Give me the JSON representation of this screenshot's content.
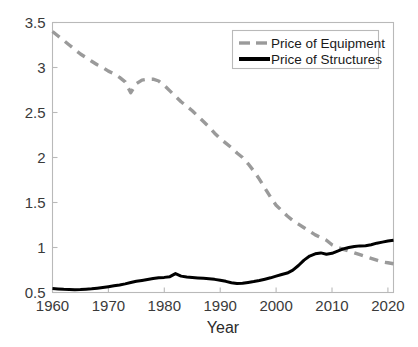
{
  "chart_data": {
    "type": "line",
    "title": "",
    "xlabel": "Year",
    "ylabel": "",
    "xlim": [
      1960,
      2021
    ],
    "ylim": [
      0.5,
      3.5
    ],
    "xticks": [
      1960,
      1970,
      1980,
      1990,
      2000,
      2010,
      2020
    ],
    "xtick_labels": [
      "1960",
      "1970",
      "1980",
      "1990",
      "2000",
      "2010",
      "2020"
    ],
    "yticks": [
      0.5,
      1,
      1.5,
      2,
      2.5,
      3,
      3.5
    ],
    "ytick_labels": [
      "0.5",
      "1",
      "1.5",
      "2",
      "2.5",
      "3",
      "3.5"
    ],
    "grid": false,
    "legend_position": "top-right",
    "x": [
      1960,
      1961,
      1962,
      1963,
      1964,
      1965,
      1966,
      1967,
      1968,
      1969,
      1970,
      1971,
      1972,
      1973,
      1974,
      1975,
      1976,
      1977,
      1978,
      1979,
      1980,
      1981,
      1982,
      1983,
      1984,
      1985,
      1986,
      1987,
      1988,
      1989,
      1990,
      1991,
      1992,
      1993,
      1994,
      1995,
      1996,
      1997,
      1998,
      1999,
      2000,
      2001,
      2002,
      2003,
      2004,
      2005,
      2006,
      2007,
      2008,
      2009,
      2010,
      2011,
      2012,
      2013,
      2014,
      2015,
      2016,
      2017,
      2018,
      2019,
      2020,
      2021
    ],
    "series": [
      {
        "name": "Price of Equipment",
        "color": "#9a9a9a",
        "style": "dashed",
        "width": 3.4,
        "values": [
          3.4,
          3.35,
          3.3,
          3.25,
          3.2,
          3.15,
          3.11,
          3.07,
          3.03,
          3.0,
          2.96,
          2.93,
          2.89,
          2.84,
          2.72,
          2.82,
          2.86,
          2.87,
          2.87,
          2.85,
          2.8,
          2.74,
          2.68,
          2.62,
          2.57,
          2.52,
          2.46,
          2.4,
          2.34,
          2.27,
          2.21,
          2.16,
          2.11,
          2.05,
          2.0,
          1.93,
          1.85,
          1.76,
          1.66,
          1.56,
          1.47,
          1.41,
          1.35,
          1.3,
          1.26,
          1.22,
          1.18,
          1.14,
          1.11,
          1.08,
          1.03,
          1.0,
          0.98,
          0.96,
          0.94,
          0.92,
          0.9,
          0.88,
          0.86,
          0.84,
          0.83,
          0.82
        ]
      },
      {
        "name": "Price of Structures",
        "color": "#000000",
        "style": "solid",
        "width": 3.0,
        "values": [
          0.545,
          0.54,
          0.535,
          0.532,
          0.53,
          0.532,
          0.536,
          0.541,
          0.548,
          0.556,
          0.565,
          0.575,
          0.584,
          0.596,
          0.611,
          0.624,
          0.634,
          0.645,
          0.656,
          0.664,
          0.668,
          0.676,
          0.71,
          0.682,
          0.672,
          0.666,
          0.661,
          0.657,
          0.652,
          0.646,
          0.637,
          0.624,
          0.608,
          0.6,
          0.602,
          0.612,
          0.622,
          0.634,
          0.648,
          0.663,
          0.682,
          0.7,
          0.716,
          0.748,
          0.8,
          0.86,
          0.905,
          0.93,
          0.94,
          0.925,
          0.935,
          0.96,
          0.985,
          1.0,
          1.01,
          1.018,
          1.02,
          1.03,
          1.048,
          1.06,
          1.072,
          1.08
        ]
      }
    ]
  },
  "legend": {
    "items": [
      {
        "label": "Price of Equipment"
      },
      {
        "label": "Price of Structures"
      }
    ]
  },
  "axes": {
    "x_title": "Year"
  }
}
